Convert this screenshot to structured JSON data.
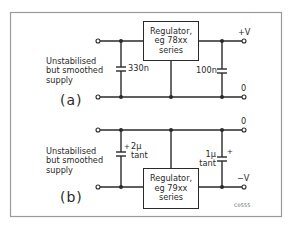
{
  "figure_code": "C0555",
  "circuits": [
    {
      "id": "a",
      "panel_label": "(a)",
      "input_label": [
        "Unstabilised",
        "but smoothed",
        "supply"
      ],
      "regulator": [
        "Regulator,",
        "eg 78xx",
        "series"
      ],
      "input_capacitor": {
        "value": "330n"
      },
      "output_capacitor": {
        "value": "100n"
      },
      "output_top_label": "+V",
      "output_bottom_label": "0"
    },
    {
      "id": "b",
      "panel_label": "(b)",
      "input_label": [
        "Unstabilised",
        "but smoothed",
        "supply"
      ],
      "regulator": [
        "Regulator,",
        "eg 79xx",
        "series"
      ],
      "input_capacitor": {
        "value": "2µ",
        "type": "tant",
        "polarity": "+"
      },
      "output_capacitor": {
        "value": "1µ",
        "type": "tant",
        "polarity": "+"
      },
      "output_top_label": "0",
      "output_bottom_label": "−V"
    }
  ]
}
